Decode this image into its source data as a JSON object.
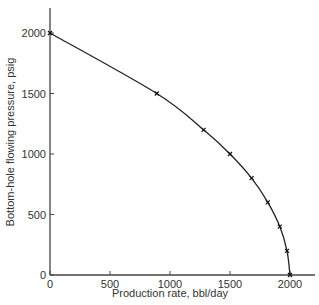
{
  "chart_data": {
    "type": "line",
    "title": "",
    "xlabel": "Production rate, bbl/day",
    "ylabel": "Bottom-hole flowing pressure, psig",
    "xlim": [
      0,
      2200
    ],
    "ylim": [
      0,
      2200
    ],
    "xticks": [
      0,
      500,
      1000,
      1500,
      2000
    ],
    "yticks": [
      0,
      500,
      1000,
      1500,
      2000
    ],
    "grid": false,
    "legend": null,
    "series": [
      {
        "name": "IPR curve",
        "marker": "x",
        "x": [
          0,
          890,
          1280,
          1500,
          1680,
          1815,
          1915,
          1975,
          2000
        ],
        "y": [
          2000,
          1500,
          1200,
          1000,
          800,
          600,
          400,
          200,
          0
        ]
      }
    ]
  },
  "labels": {
    "xlabel": "Production rate, bbl/day",
    "ylabel": "Bottom-hole flowing pressure, psig",
    "xticks": [
      "0",
      "500",
      "1000",
      "1500",
      "2000"
    ],
    "yticks": [
      "0",
      "500",
      "1000",
      "1500",
      "2000"
    ]
  }
}
